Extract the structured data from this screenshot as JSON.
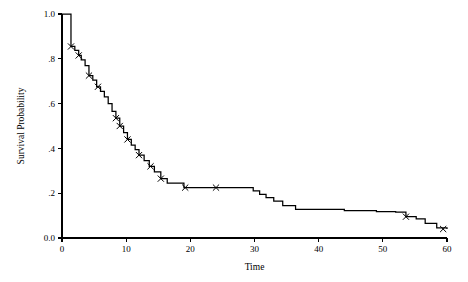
{
  "chart_data": {
    "type": "line",
    "subtype": "kaplan-meier-step",
    "title": "",
    "xlabel": "Time",
    "ylabel": "Survival Probability",
    "xlim": [
      0,
      60
    ],
    "ylim": [
      0.0,
      1.0
    ],
    "grid": false,
    "legend": null,
    "xticks": [
      0,
      10,
      20,
      30,
      40,
      50,
      60
    ],
    "xticklabels": [
      "0",
      "10",
      "20",
      "30",
      "40",
      "50",
      "60"
    ],
    "yticks": [
      0.0,
      0.2,
      0.4,
      0.6,
      0.8,
      1.0
    ],
    "yticklabels": [
      "0.0",
      ".2",
      ".4",
      ".6",
      ".8",
      "1.0"
    ],
    "series": [
      {
        "name": "Survival function",
        "style": "step-post",
        "x": [
          0,
          1.0,
          1.4,
          2.0,
          2.6,
          3.0,
          3.6,
          4.2,
          4.8,
          5.4,
          6.0,
          6.6,
          7.2,
          7.8,
          8.4,
          9.0,
          9.6,
          10.2,
          10.8,
          11.4,
          12.0,
          12.8,
          13.6,
          14.4,
          15.4,
          16.4,
          19.0,
          24.0,
          28.8,
          29.8,
          30.8,
          31.8,
          33.0,
          34.4,
          36.4,
          44.0,
          49.0,
          52.0,
          53.6,
          55.2,
          56.6,
          58.4,
          60.0
        ],
        "y": [
          1.0,
          1.0,
          0.855,
          0.838,
          0.815,
          0.795,
          0.77,
          0.725,
          0.705,
          0.675,
          0.655,
          0.63,
          0.6,
          0.565,
          0.535,
          0.5,
          0.47,
          0.44,
          0.415,
          0.395,
          0.37,
          0.345,
          0.32,
          0.295,
          0.265,
          0.245,
          0.225,
          0.225,
          0.225,
          0.21,
          0.195,
          0.18,
          0.165,
          0.145,
          0.128,
          0.122,
          0.118,
          0.115,
          0.095,
          0.085,
          0.065,
          0.045,
          0.04
        ]
      }
    ],
    "censored_points": [
      {
        "x": 1.4,
        "y": 0.855
      },
      {
        "x": 2.6,
        "y": 0.815
      },
      {
        "x": 4.2,
        "y": 0.725
      },
      {
        "x": 5.6,
        "y": 0.675
      },
      {
        "x": 8.4,
        "y": 0.535
      },
      {
        "x": 9.0,
        "y": 0.5
      },
      {
        "x": 10.2,
        "y": 0.44
      },
      {
        "x": 12.0,
        "y": 0.37
      },
      {
        "x": 13.8,
        "y": 0.32
      },
      {
        "x": 15.4,
        "y": 0.265
      },
      {
        "x": 19.2,
        "y": 0.225
      },
      {
        "x": 24.0,
        "y": 0.225
      },
      {
        "x": 53.6,
        "y": 0.095
      },
      {
        "x": 59.4,
        "y": 0.04
      }
    ]
  },
  "colors": {
    "line": "#000000",
    "axis": "#000000",
    "background": "#ffffff"
  }
}
